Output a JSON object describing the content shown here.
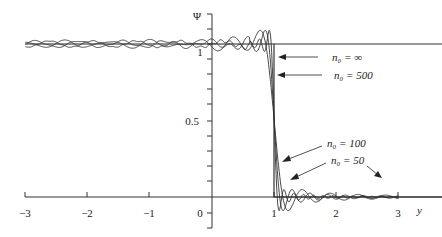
{
  "chart_data": {
    "type": "line",
    "title": "",
    "xlabel": "y",
    "ylabel": "Ψ",
    "xlim": [
      -3,
      3
    ],
    "ylim": [
      0,
      1.1
    ],
    "grid": false,
    "x_ticks": [
      "−3",
      "−2",
      "−1",
      "0",
      "1",
      "2",
      "3"
    ],
    "y_ticks": [
      "0",
      "0.5",
      "1"
    ],
    "series": [
      {
        "name": "n₀ = ∞",
        "n0": "inf",
        "description": "ideal step: Ψ = 1 for y < 1, Ψ = 0 for y > 1"
      },
      {
        "name": "n₀ = 500",
        "n0": 500,
        "description": "steep transition near y = 1 with Gibbs overshoot"
      },
      {
        "name": "n₀ = 100",
        "n0": 100,
        "description": "transition near y = 1 with ripples"
      },
      {
        "name": "n₀ = 50",
        "n0": 50,
        "description": "widest transition, largest ripples"
      }
    ],
    "annotations": [
      {
        "text": "n₀ = ∞",
        "x_label": 1.6,
        "y_label": 0.9,
        "arrow_to": [
          1.05,
          0.9
        ]
      },
      {
        "text": "n₀ = 500",
        "x_label": 1.6,
        "y_label": 0.78,
        "arrow_to": [
          1.02,
          0.78
        ]
      },
      {
        "text": "n₀ = 100",
        "x_label": 1.6,
        "y_label": 0.28,
        "arrow_to": [
          1.05,
          0.18
        ]
      },
      {
        "text": "n₀ = 50",
        "x_label": 1.7,
        "y_label": 0.2,
        "arrow_to": [
          1.12,
          0.07
        ]
      },
      {
        "text": "",
        "x_label": 2.45,
        "y_label": 0.17,
        "arrow_to": [
          2.7,
          0.09
        ]
      }
    ]
  },
  "labels": {
    "psi": "Ψ",
    "yaxis_1": "1",
    "yaxis_05": "0.5",
    "yaxis_0": "0",
    "x_axis_name": "y",
    "ann_inf": "n₀ = ∞",
    "ann_500": "n₀ = 500",
    "ann_100": "n₀ = 100",
    "ann_50": "n₀ = 50",
    "xt_m3": "−3",
    "xt_m2": "−2",
    "xt_m1": "−1",
    "xt_0": "0",
    "xt_1": "1",
    "xt_2": "2",
    "xt_3": "3"
  }
}
